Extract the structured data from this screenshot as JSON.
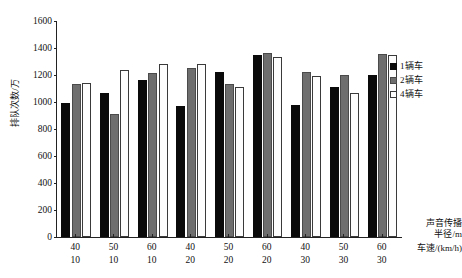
{
  "chart_data": {
    "type": "bar",
    "title": "",
    "xlabel": "声音传播半径/m 车速/(km/h)",
    "ylabel": "排队次数/万",
    "ylim": [
      0,
      1600
    ],
    "yticks": [
      0,
      200,
      400,
      600,
      800,
      1000,
      1200,
      1400,
      1600
    ],
    "grid": false,
    "legend_position": "right",
    "categories": [
      "40 / 10",
      "50 / 10",
      "60 / 10",
      "40 / 20",
      "50 / 20",
      "60 / 20",
      "40 / 30",
      "50 / 30",
      "60 / 30"
    ],
    "category_radius": [
      "40",
      "50",
      "60",
      "40",
      "50",
      "60",
      "40",
      "50",
      "60"
    ],
    "category_speed": [
      "10",
      "10",
      "10",
      "20",
      "20",
      "20",
      "30",
      "30",
      "30"
    ],
    "series": [
      {
        "name": "1辆车",
        "color": "#0a0a0a",
        "values": [
          990,
          1070,
          1160,
          970,
          1220,
          1350,
          980,
          1110,
          1200
        ]
      },
      {
        "name": "2辆车",
        "color": "#6e6e6e",
        "values": [
          1130,
          910,
          1215,
          1255,
          1130,
          1360,
          1220,
          1200,
          1355
        ]
      },
      {
        "name": "4辆车",
        "color": "#ffffff",
        "values": [
          1140,
          1240,
          1280,
          1285,
          1110,
          1330,
          1195,
          1070,
          1350
        ]
      }
    ]
  },
  "axis": {
    "y_label": "排队次数/万",
    "x_caption_line1": "声音传播",
    "x_caption_line2": "半径/m",
    "x_caption_line3": "车速/(km/h)"
  },
  "legend": {
    "items": [
      {
        "label": "1辆车"
      },
      {
        "label": "2辆车"
      },
      {
        "label": "4辆车"
      }
    ]
  }
}
